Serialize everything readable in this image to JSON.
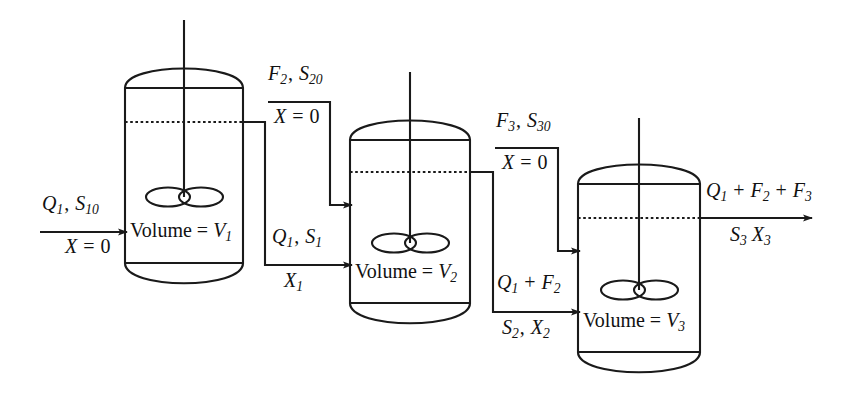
{
  "diagram": {
    "type": "process-flow-diagram",
    "stroke_color": "#1a1a1a",
    "background_color": "#ffffff"
  },
  "tanks": [
    {
      "id": "tank-1",
      "volume_label_prefix": "Volume = ",
      "volume_symbol": "V",
      "volume_index": "1",
      "volume_label": "Volume = V1"
    },
    {
      "id": "tank-2",
      "volume_label_prefix": "Volume = ",
      "volume_symbol": "V",
      "volume_index": "2",
      "volume_label": "Volume = V2"
    },
    {
      "id": "tank-3",
      "volume_label_prefix": "Volume = ",
      "volume_symbol": "V",
      "volume_index": "3",
      "volume_label": "Volume = V3"
    }
  ],
  "streams": [
    {
      "id": "feed-1",
      "target": "tank-1",
      "above_parts": [
        {
          "text": "Q",
          "sub": "1"
        },
        {
          "text": ", ",
          "sub": ""
        },
        {
          "text": "S",
          "sub": "10"
        }
      ],
      "above_text": "Q1, S10",
      "below_text": "X = 0",
      "below_symbol": "X",
      "below_value": "0",
      "has_rule": true
    },
    {
      "id": "feed-2",
      "target": "tank-2",
      "above_parts": [
        {
          "text": "F",
          "sub": "2"
        },
        {
          "text": ", ",
          "sub": ""
        },
        {
          "text": "S",
          "sub": "20"
        }
      ],
      "above_text": "F2, S20",
      "below_text": "X = 0",
      "below_symbol": "X",
      "below_value": "0",
      "has_rule": true
    },
    {
      "id": "feed-3",
      "target": "tank-3",
      "above_parts": [
        {
          "text": "F",
          "sub": "3"
        },
        {
          "text": ", ",
          "sub": ""
        },
        {
          "text": "S",
          "sub": "30"
        }
      ],
      "above_text": "F3, S30",
      "below_text": "X = 0",
      "below_symbol": "X",
      "below_value": "0",
      "has_rule": true
    },
    {
      "id": "transfer-1-to-2",
      "source": "tank-1",
      "target": "tank-2",
      "above_text": "Q1, S1",
      "below_text": "X1",
      "has_rule": false
    },
    {
      "id": "transfer-2-to-3",
      "source": "tank-2",
      "target": "tank-3",
      "above_text": "Q1 + F2",
      "below_text": "S2, X2",
      "has_rule": false
    },
    {
      "id": "effluent-3",
      "source": "tank-3",
      "above_text": "Q1 + F2 + F3",
      "below_text": "S3 X3",
      "has_rule": false
    }
  ],
  "symbols": {
    "Q": "Q",
    "S": "S",
    "F": "F",
    "X": "X",
    "V": "V",
    "equals": "=",
    "plus": "+",
    "comma": ",",
    "zero": "0"
  }
}
